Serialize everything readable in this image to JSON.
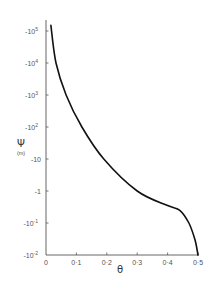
{
  "chart_data": {
    "type": "line",
    "title": "",
    "xlabel": "θ",
    "ylabel": "Ψ",
    "ylabel_unit": "(m)",
    "xlim": [
      0,
      0.5
    ],
    "y_scale": "log (negative values, magnitude increases upward)",
    "ylim": [
      -0.01,
      -100000
    ],
    "x_ticks": [
      "0",
      "0.1",
      "0.2",
      "0.3",
      "0.4",
      "0.5"
    ],
    "y_ticks": [
      "-10^5",
      "-10^4",
      "-10^3",
      "-10^2",
      "-10",
      "-1",
      "-10^-1",
      "-10^-2"
    ],
    "grid": false,
    "legend": null,
    "series": [
      {
        "name": "Ψ(θ)",
        "x": [
          0.016,
          0.033,
          0.066,
          0.118,
          0.19,
          0.3,
          0.4,
          0.44,
          0.47,
          0.49,
          0.5
        ],
        "y": [
          -150000,
          -10000,
          -1000,
          -100,
          -10,
          -1,
          -0.35,
          -0.25,
          -0.1,
          -0.03,
          -0.01
        ]
      }
    ]
  },
  "labels": {
    "x_title": "θ",
    "y_title": "Ψ",
    "y_unit": "(m)",
    "x_ticks": [
      "0",
      "0·1",
      "0·2",
      "0·3",
      "0·4",
      "0·5"
    ],
    "y_ticks": [
      {
        "base": "-10",
        "exp": "5"
      },
      {
        "base": "-10",
        "exp": "4"
      },
      {
        "base": "-10",
        "exp": "3"
      },
      {
        "base": "-10",
        "exp": "2"
      },
      {
        "base": "-10",
        "exp": ""
      },
      {
        "base": "-1",
        "exp": ""
      },
      {
        "base": "-10",
        "exp": "-1"
      },
      {
        "base": "-10",
        "exp": "-2"
      }
    ]
  },
  "colors": {
    "axis": "#555555",
    "curve": "#111111",
    "text": "#555555"
  }
}
